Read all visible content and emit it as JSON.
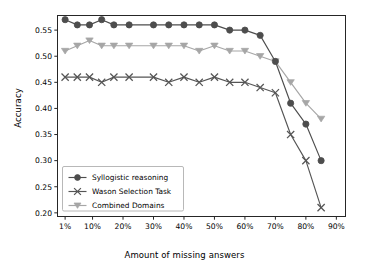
{
  "chart_data": {
    "type": "line",
    "title": "",
    "xlabel": "Amount of missing answers",
    "ylabel": "Accuracy",
    "grid": false,
    "legend_position": "lower left",
    "x": [
      1,
      5,
      9,
      13,
      17,
      22,
      30,
      35,
      40,
      45,
      50,
      55,
      60,
      65,
      70,
      75,
      80,
      85
    ],
    "xtick_labels": [
      "1%",
      "10%",
      "20%",
      "30%",
      "40%",
      "50%",
      "60%",
      "70%",
      "80%",
      "90%"
    ],
    "xtick_values": [
      1,
      10,
      20,
      30,
      40,
      50,
      60,
      70,
      80,
      90
    ],
    "ytick_labels": [
      "0.20",
      "0.25",
      "0.30",
      "0.35",
      "0.40",
      "0.45",
      "0.50",
      "0.55"
    ],
    "ytick_values": [
      0.2,
      0.25,
      0.3,
      0.35,
      0.4,
      0.45,
      0.5,
      0.55
    ],
    "xlim": [
      -1.5,
      93
    ],
    "ylim": [
      0.193,
      0.578
    ],
    "series": [
      {
        "name": "Syllogistic reasoning",
        "marker": "circle",
        "color": "#4d4d4d",
        "values": [
          0.57,
          0.56,
          0.56,
          0.57,
          0.56,
          0.56,
          0.56,
          0.56,
          0.56,
          0.56,
          0.56,
          0.55,
          0.55,
          0.54,
          0.49,
          0.41,
          0.37,
          0.3
        ]
      },
      {
        "name": "Wason Selection Task",
        "marker": "x",
        "color": "#555555",
        "values": [
          0.46,
          0.46,
          0.46,
          0.45,
          0.46,
          0.46,
          0.46,
          0.45,
          0.46,
          0.45,
          0.46,
          0.45,
          0.45,
          0.44,
          0.43,
          0.35,
          0.3,
          0.21
        ]
      },
      {
        "name": "Combined Domains",
        "marker": "triangle-down",
        "color": "#a6a6a6",
        "values": [
          0.51,
          0.52,
          0.53,
          0.52,
          0.52,
          0.52,
          0.52,
          0.52,
          0.52,
          0.51,
          0.52,
          0.51,
          0.51,
          0.5,
          0.49,
          0.45,
          0.41,
          0.38
        ]
      }
    ]
  },
  "axes": {
    "ylabel": "Accuracy",
    "xlabel": "Amount of missing answers"
  },
  "legend": {
    "entries": [
      {
        "label": "Syllogistic reasoning"
      },
      {
        "label": "Wason Selection Task"
      },
      {
        "label": "Combined Domains"
      }
    ]
  },
  "colors": {
    "series_1": "#4d4d4d",
    "series_2": "#555555",
    "series_3": "#a6a6a6",
    "axis": "#262626",
    "background": "#ffffff"
  }
}
